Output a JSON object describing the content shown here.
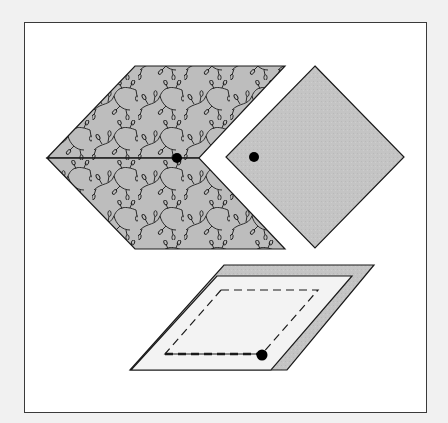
{
  "figure": {
    "type": "quilt-piecing-diagram",
    "caption": "",
    "colors": {
      "page_background": "#f1f1f1",
      "frame_fill": "#ffffff",
      "frame_stroke": "#3a3a3a",
      "print_fabric_fill": "#bdbdbd",
      "print_motif_stroke": "#1a1a1a",
      "solid_fabric_fill": "#c4c4c4",
      "template_fill": "#f3f3f3",
      "backing_fill": "#bcbcbc",
      "outline_stroke": "#1a1a1a",
      "dot_fill": "#000000"
    },
    "pieces": [
      {
        "id": "chevron-upper",
        "description": "Upper diamond of vine-print fabric",
        "pattern": "vine-print"
      },
      {
        "id": "chevron-lower",
        "description": "Lower diamond of vine-print fabric",
        "pattern": "vine-print"
      },
      {
        "id": "square-diamond",
        "description": "Solid gray square set on point",
        "pattern": "solid"
      },
      {
        "id": "template",
        "description": "Light parallelogram template with dashed sewing line over gray fabric",
        "pattern": "template"
      }
    ],
    "markers": [
      {
        "id": "dot-chevron",
        "description": "Matching dot at inner seam of chevron"
      },
      {
        "id": "dot-square",
        "description": "Matching dot at left corner of square"
      },
      {
        "id": "dot-template",
        "description": "Matching dot at corner of dashed sewing line"
      }
    ]
  }
}
